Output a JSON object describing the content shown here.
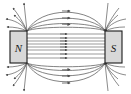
{
  "figure": {
    "width": 131,
    "height": 94,
    "background_color": "#ffffff"
  },
  "colors": {
    "magnet_fill": "#d8d8d8",
    "magnet_stroke": "#1a1a1a",
    "field_line": "#595959",
    "inner_field_line": "#6e6e6e",
    "label_text": "#1a1a1a",
    "background": "#ffffff"
  },
  "magnets": [
    {
      "id": "north-pole",
      "label": "N",
      "x": 10,
      "y": 31,
      "width": 17,
      "height": 32,
      "fill": "#d8d8d8",
      "stroke": "#1a1a1a"
    },
    {
      "id": "south-pole",
      "label": "S",
      "x": 105,
      "y": 31,
      "width": 17,
      "height": 32,
      "fill": "#d8d8d8",
      "stroke": "#1a1a1a"
    }
  ],
  "field": {
    "direction": "north-to-south",
    "arrow_direction": "right",
    "straight_line_count": 8,
    "straight_line_y_values": [
      34,
      38,
      41,
      44,
      47,
      50,
      54,
      58
    ],
    "straight_line_x_start": 27,
    "straight_line_x_end": 105,
    "straight_arrow_x": 64,
    "arc_count_top": 4,
    "arc_count_bottom": 4,
    "top_arc_peaks": [
      10,
      18,
      25,
      30
    ],
    "bottom_arc_peaks": [
      84,
      76,
      69,
      64
    ],
    "fan_line_count_per_corner": 5,
    "arc_arrow_position": 0.52
  },
  "labels": {
    "north": "N",
    "south": "S"
  }
}
